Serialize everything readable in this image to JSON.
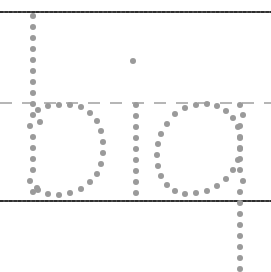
{
  "worksheet": {
    "title": "Handwriting Tracing Worksheet",
    "word": "big",
    "background_color": "#ffffff",
    "dot_color": "#9a9a9a",
    "line_color": "#3a3a3a",
    "dashed_line_color": "#b6b6b6",
    "canvas": {
      "width": 271,
      "height": 272
    }
  },
  "guide_lines": [
    {
      "name": "top-line",
      "style": "solid",
      "y": 11,
      "label": "top line"
    },
    {
      "name": "mid-line",
      "style": "dashed",
      "y": 102,
      "label": "dashed midline"
    },
    {
      "name": "base-line",
      "style": "solid",
      "y": 200,
      "label": "baseline"
    }
  ],
  "letters": [
    {
      "name": "letter-b",
      "char": "b",
      "dots": [
        [
          33,
          16
        ],
        [
          33,
          27
        ],
        [
          33,
          38
        ],
        [
          33,
          49
        ],
        [
          33,
          60
        ],
        [
          33,
          71
        ],
        [
          33,
          82
        ],
        [
          33,
          93
        ],
        [
          33,
          104
        ],
        [
          33,
          115
        ],
        [
          30,
          126
        ],
        [
          33,
          137
        ],
        [
          33,
          148
        ],
        [
          33,
          159
        ],
        [
          33,
          170
        ],
        [
          30,
          181
        ],
        [
          33,
          192
        ],
        [
          38,
          110
        ],
        [
          48,
          106
        ],
        [
          59,
          105
        ],
        [
          70,
          105
        ],
        [
          81,
          107
        ],
        [
          90,
          113
        ],
        [
          97,
          121
        ],
        [
          101,
          131
        ],
        [
          103,
          142
        ],
        [
          103,
          153
        ],
        [
          101,
          164
        ],
        [
          97,
          174
        ],
        [
          90,
          182
        ],
        [
          81,
          189
        ],
        [
          70,
          193
        ],
        [
          59,
          195
        ],
        [
          48,
          194
        ],
        [
          38,
          190
        ],
        [
          40,
          122
        ],
        [
          37,
          188
        ]
      ]
    },
    {
      "name": "letter-i",
      "char": "i",
      "dots": [
        [
          133,
          61
        ],
        [
          136,
          105
        ],
        [
          136,
          116
        ],
        [
          136,
          127
        ],
        [
          136,
          138
        ],
        [
          136,
          149
        ],
        [
          136,
          160
        ],
        [
          136,
          171
        ],
        [
          136,
          182
        ],
        [
          136,
          193
        ]
      ]
    },
    {
      "name": "letter-g",
      "char": "g",
      "dots": [
        [
          196,
          105
        ],
        [
          207,
          104
        ],
        [
          217,
          106
        ],
        [
          226,
          111
        ],
        [
          233,
          118
        ],
        [
          238,
          127
        ],
        [
          240,
          138
        ],
        [
          240,
          149
        ],
        [
          238,
          160
        ],
        [
          233,
          170
        ],
        [
          226,
          179
        ],
        [
          217,
          186
        ],
        [
          207,
          191
        ],
        [
          196,
          193
        ],
        [
          185,
          194
        ],
        [
          175,
          191
        ],
        [
          167,
          185
        ],
        [
          161,
          176
        ],
        [
          158,
          166
        ],
        [
          157,
          155
        ],
        [
          158,
          144
        ],
        [
          161,
          134
        ],
        [
          167,
          124
        ],
        [
          175,
          114
        ],
        [
          185,
          108
        ],
        [
          240,
          105
        ],
        [
          243,
          115
        ],
        [
          240,
          126
        ],
        [
          240,
          137
        ],
        [
          240,
          148
        ],
        [
          240,
          159
        ],
        [
          240,
          170
        ],
        [
          243,
          181
        ],
        [
          240,
          192
        ],
        [
          240,
          203
        ],
        [
          240,
          214
        ],
        [
          240,
          225
        ],
        [
          240,
          236
        ],
        [
          240,
          247
        ],
        [
          240,
          258
        ],
        [
          240,
          269
        ]
      ]
    }
  ]
}
